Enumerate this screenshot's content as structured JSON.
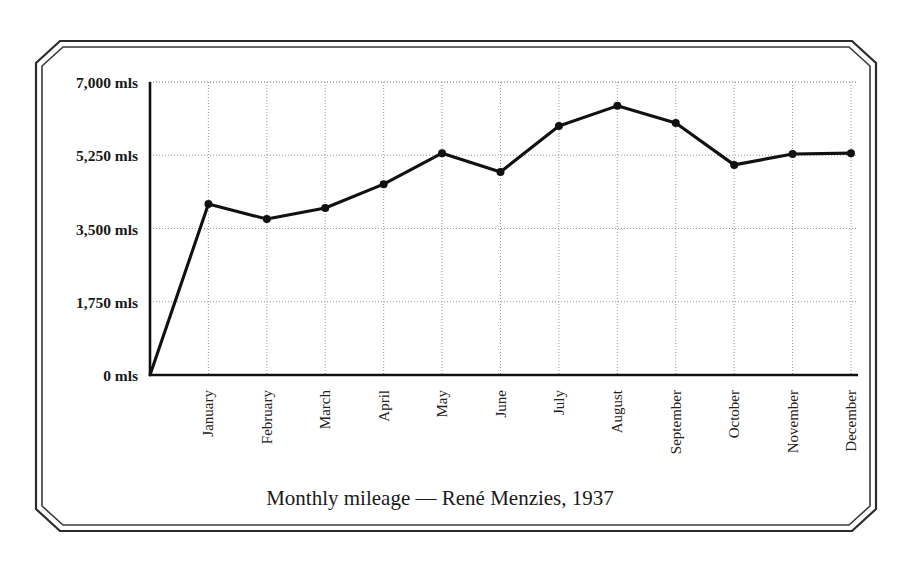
{
  "chart_data": {
    "type": "line",
    "title": "Monthly mileage — René Menzies, 1937",
    "xlabel": "",
    "ylabel": "",
    "categories": [
      "January",
      "February",
      "March",
      "April",
      "May",
      "June",
      "July",
      "August",
      "September",
      "October",
      "November",
      "December"
    ],
    "values": [
      4085,
      3725,
      3990,
      4560,
      5300,
      4850,
      5950,
      6430,
      6020,
      5020,
      5280,
      5300
    ],
    "series": [
      {
        "name": "Monthly mileage",
        "values": [
          4085,
          3725,
          3990,
          4560,
          5300,
          4850,
          5950,
          6430,
          6020,
          5020,
          5280,
          5300
        ]
      }
    ],
    "origin_value": 0,
    "ylim": [
      0,
      7000
    ],
    "yticks": [
      0,
      1750,
      3500,
      5250,
      7000
    ],
    "ytick_labels": [
      "0 mls",
      "1,750 mls",
      "3,500 mls",
      "5,250 mls",
      "7,000 mls"
    ],
    "unit": "mls",
    "grid": true,
    "grid_style": "dotted",
    "legend": false,
    "marker": "circle",
    "line_color": "#111111",
    "marker_color": "#111111",
    "grid_color": "#9a9a9a",
    "axis_color": "#111111",
    "background_color": "#ffffff",
    "xtick_rotation": 90
  },
  "frame": {
    "style": "double-line-chamfered",
    "color": "#2b2b2b"
  }
}
